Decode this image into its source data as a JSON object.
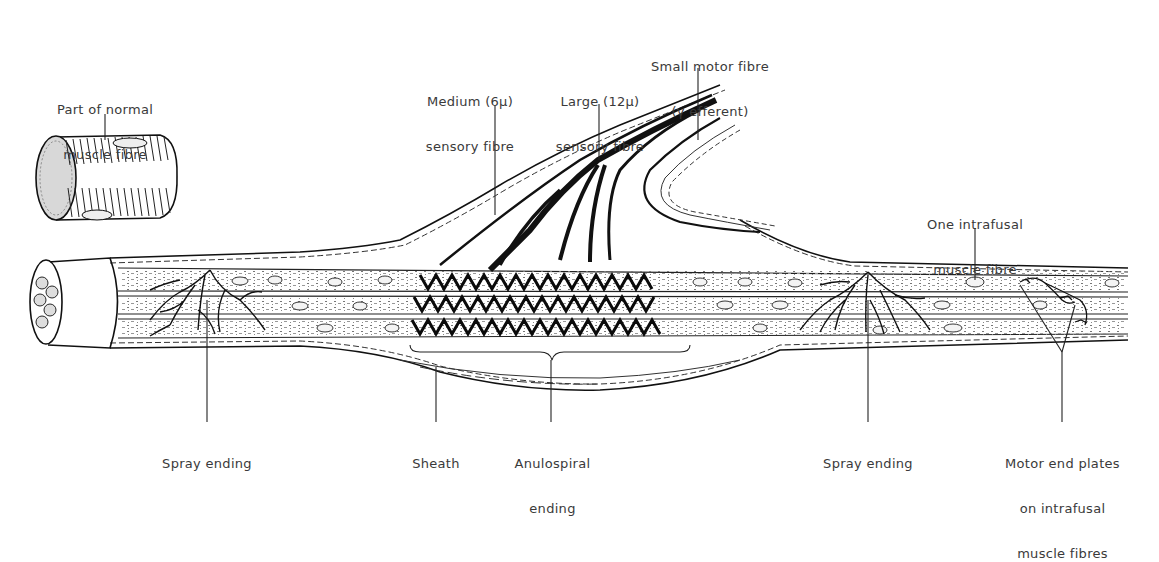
{
  "figure": {
    "labels": {
      "normal_fibre": [
        "Part of normal",
        "muscle fibre"
      ],
      "medium_sensory": [
        "Medium (6μ)",
        "sensory fibre"
      ],
      "large_sensory": [
        "Large (12μ)",
        "sensory fibre"
      ],
      "small_motor": [
        "Small motor fibre",
        "(γ efferent)"
      ],
      "one_intrafusal": [
        "One intrafusal",
        "muscle fibre"
      ],
      "spray_ending_left": [
        "Spray ending"
      ],
      "sheath": [
        "Sheath"
      ],
      "anulospiral": [
        "Anulospiral",
        "ending"
      ],
      "spray_ending_right": [
        "Spray ending"
      ],
      "motor_end_plates": [
        "Motor end plates",
        "on intrafusal",
        "muscle fibres"
      ]
    },
    "colors": {
      "ink": "#111111",
      "label_text": "#3a3a3a",
      "background": "#ffffff"
    }
  }
}
